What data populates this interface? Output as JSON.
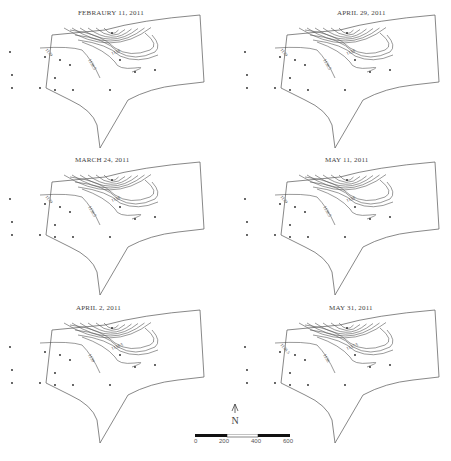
{
  "figure": {
    "panels": [
      {
        "id": "feb11",
        "title": "FEBRAURY 11, 2011",
        "contour_labels": [
          "1138",
          "1138.5",
          "1139"
        ]
      },
      {
        "id": "apr29",
        "title": "APRIL 29, 2011",
        "contour_labels": [
          "1138",
          "1138.5",
          "1139"
        ]
      },
      {
        "id": "mar24",
        "title": "MARCH 24, 2011",
        "contour_labels": [
          "1138",
          "1138.5",
          "1139"
        ]
      },
      {
        "id": "may11",
        "title": "MAY 11, 2011",
        "contour_labels": [
          "1138",
          "1138.5",
          "1139"
        ]
      },
      {
        "id": "apr2",
        "title": "APRIL 2, 2011",
        "contour_labels": [
          "1138.5",
          "1139"
        ]
      },
      {
        "id": "may31",
        "title": "MAY 31, 2011",
        "contour_labels": [
          "1137.5",
          "1138",
          "1138.5"
        ]
      }
    ],
    "north_arrow": {
      "label": "N",
      "icon": "north-arrow-icon"
    },
    "scale_bar": {
      "ticks": [
        "0",
        "200",
        "400",
        "600"
      ]
    },
    "colors": {
      "line": "#555555",
      "text": "#444444",
      "bar_fill": "#111111"
    }
  }
}
